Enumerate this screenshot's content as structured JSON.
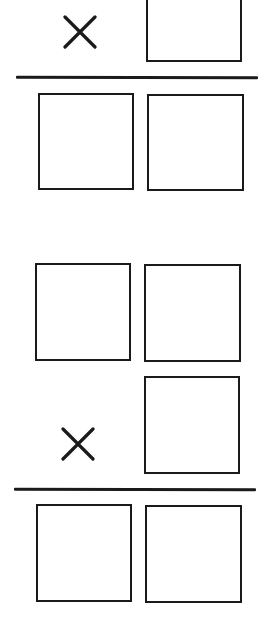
{
  "worksheet": {
    "problems": [
      {
        "operator": "×",
        "operator_icon": "multiplication-sign-icon",
        "multiplicand_boxes": 1,
        "product_boxes": 2,
        "stroke_color": "#1a1a1a"
      },
      {
        "operator": "×",
        "operator_icon": "multiplication-sign-icon",
        "multiplicand_boxes": 2,
        "multiplier_boxes": 1,
        "product_boxes": 2,
        "stroke_color": "#1a1a1a"
      }
    ]
  }
}
